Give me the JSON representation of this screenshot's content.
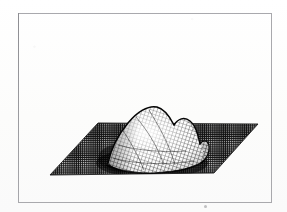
{
  "figure": {
    "domain_label": "3d-surface-mesh-plot",
    "background_color": "#fdfdfd",
    "frame": {
      "border_color": "#a9a9ad",
      "x": 18,
      "y": 13,
      "width": 254,
      "height": 190
    },
    "caption": "",
    "title": "",
    "axis_labels": {
      "x": "",
      "y": "",
      "z": ""
    },
    "tick_labels": [],
    "legend": []
  },
  "chart_data": {
    "type": "surface",
    "render_style": "wireframe-mesh-halftone",
    "title": "",
    "xlabel": "",
    "ylabel": "",
    "zlabel": "",
    "grid": true,
    "legend_position": "none",
    "colors": {
      "base_plane_dark": "#1b1b1b",
      "base_plane_mesh_line": "#d8d8d8",
      "peak_mesh_light": "#f2f2f2",
      "peak_mesh_line": "#111111",
      "shadow": "#000000",
      "page": "#fdfdfd",
      "frame": "#a9a9ad"
    },
    "projection": {
      "type": "oblique-parallel",
      "base_plane_vertices_px": [
        {
          "name": "left",
          "x": 32,
          "y": 162
        },
        {
          "name": "back",
          "x": 80,
          "y": 110
        },
        {
          "name": "right",
          "x": 240,
          "y": 111
        },
        {
          "name": "front",
          "x": 196,
          "y": 160
        }
      ],
      "grid_divisions_u": 46,
      "grid_divisions_v": 30
    },
    "surface": {
      "description": "Single dominant unimodal peak rising near the center-left of the plane with a lower secondary shoulder ridge on its right flank; the surface returns to the flat base plane at the edges.",
      "peak_apex_px": {
        "x": 137,
        "y": 95
      },
      "peak_height_px": 62,
      "secondary_ridge_px": {
        "x": 176,
        "y": 112
      },
      "x": [
        -3.0,
        -2.6,
        -2.2,
        -1.8,
        -1.4,
        -1.0,
        -0.6,
        -0.2,
        0.2,
        0.6,
        1.0,
        1.4,
        1.8,
        2.2,
        2.6,
        3.0
      ],
      "y": [
        -3.0,
        -2.6,
        -2.2,
        -1.8,
        -1.4,
        -1.0,
        -0.6,
        -0.2,
        0.2,
        0.6,
        1.0,
        1.4,
        1.8,
        2.2,
        2.6,
        3.0
      ],
      "zlim": [
        0.0,
        1.0
      ],
      "z": [
        [
          0.0,
          0.0,
          0.0,
          0.0,
          0.0,
          0.0,
          0.0,
          0.0,
          0.0,
          0.0,
          0.0,
          0.0,
          0.0,
          0.0,
          0.0,
          0.0
        ],
        [
          0.0,
          0.0,
          0.0,
          0.0,
          0.01,
          0.01,
          0.01,
          0.01,
          0.01,
          0.01,
          0.01,
          0.0,
          0.0,
          0.0,
          0.0,
          0.0
        ],
        [
          0.0,
          0.0,
          0.01,
          0.02,
          0.03,
          0.05,
          0.06,
          0.07,
          0.07,
          0.06,
          0.05,
          0.03,
          0.02,
          0.01,
          0.0,
          0.0
        ],
        [
          0.0,
          0.0,
          0.02,
          0.05,
          0.1,
          0.16,
          0.21,
          0.24,
          0.24,
          0.21,
          0.16,
          0.1,
          0.05,
          0.02,
          0.0,
          0.0
        ],
        [
          0.0,
          0.01,
          0.04,
          0.11,
          0.22,
          0.35,
          0.46,
          0.52,
          0.52,
          0.46,
          0.35,
          0.22,
          0.11,
          0.04,
          0.01,
          0.0
        ],
        [
          0.0,
          0.01,
          0.06,
          0.18,
          0.36,
          0.57,
          0.74,
          0.83,
          0.83,
          0.74,
          0.57,
          0.36,
          0.18,
          0.06,
          0.01,
          0.0
        ],
        [
          0.0,
          0.02,
          0.07,
          0.23,
          0.47,
          0.73,
          0.93,
          1.0,
          1.0,
          0.93,
          0.73,
          0.47,
          0.23,
          0.07,
          0.02,
          0.0
        ],
        [
          0.0,
          0.02,
          0.07,
          0.24,
          0.49,
          0.76,
          0.96,
          1.0,
          1.0,
          0.96,
          0.76,
          0.49,
          0.24,
          0.07,
          0.02,
          0.0
        ],
        [
          0.0,
          0.02,
          0.07,
          0.23,
          0.47,
          0.73,
          0.93,
          0.99,
          0.99,
          0.93,
          0.73,
          0.47,
          0.23,
          0.07,
          0.02,
          0.0
        ],
        [
          0.0,
          0.01,
          0.06,
          0.19,
          0.38,
          0.6,
          0.77,
          0.86,
          0.86,
          0.77,
          0.6,
          0.38,
          0.19,
          0.06,
          0.01,
          0.0
        ],
        [
          0.0,
          0.01,
          0.04,
          0.12,
          0.24,
          0.39,
          0.51,
          0.57,
          0.57,
          0.51,
          0.39,
          0.24,
          0.12,
          0.04,
          0.01,
          0.0
        ],
        [
          0.0,
          0.0,
          0.02,
          0.06,
          0.13,
          0.21,
          0.28,
          0.32,
          0.32,
          0.28,
          0.21,
          0.13,
          0.06,
          0.02,
          0.0,
          0.0
        ],
        [
          0.0,
          0.0,
          0.01,
          0.02,
          0.05,
          0.09,
          0.12,
          0.14,
          0.14,
          0.12,
          0.09,
          0.05,
          0.02,
          0.01,
          0.0,
          0.0
        ],
        [
          0.0,
          0.0,
          0.0,
          0.01,
          0.02,
          0.03,
          0.04,
          0.05,
          0.05,
          0.04,
          0.03,
          0.02,
          0.01,
          0.0,
          0.0,
          0.0
        ],
        [
          0.0,
          0.0,
          0.0,
          0.0,
          0.0,
          0.01,
          0.01,
          0.01,
          0.01,
          0.01,
          0.01,
          0.0,
          0.0,
          0.0,
          0.0,
          0.0
        ],
        [
          0.0,
          0.0,
          0.0,
          0.0,
          0.0,
          0.0,
          0.0,
          0.0,
          0.0,
          0.0,
          0.0,
          0.0,
          0.0,
          0.0,
          0.0,
          0.0
        ]
      ]
    }
  }
}
